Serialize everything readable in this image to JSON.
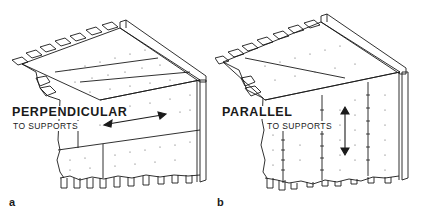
{
  "figure": {
    "panels": [
      {
        "id": "a",
        "letter": "a",
        "orientation_label": "PERPENDICULAR",
        "sub_label": "TO SUPPORTS",
        "arrow_direction": "horizontal-double"
      },
      {
        "id": "b",
        "letter": "b",
        "orientation_label": "PARALLEL",
        "sub_label": "TO SUPPORTS",
        "arrow_direction": "vertical-double"
      }
    ],
    "colors": {
      "line": "#1a1a1a",
      "background": "#ffffff",
      "dots": "#555555"
    }
  }
}
